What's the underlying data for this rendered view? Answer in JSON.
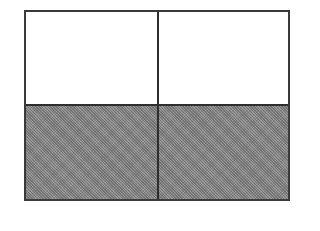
{
  "diagram": {
    "type": "fraction-grid",
    "rows": 2,
    "columns": 2,
    "total_parts": 4,
    "shaded_parts": 2,
    "fraction_shaded": "2/4",
    "cells": [
      {
        "row": 0,
        "col": 0,
        "state": "unshaded"
      },
      {
        "row": 0,
        "col": 1,
        "state": "unshaded"
      },
      {
        "row": 1,
        "col": 0,
        "state": "shaded"
      },
      {
        "row": 1,
        "col": 1,
        "state": "shaded"
      }
    ],
    "colors": {
      "border": "#3a3a3a",
      "shaded_fill": "#8c8c8c",
      "unshaded_fill": "#ffffff"
    }
  }
}
